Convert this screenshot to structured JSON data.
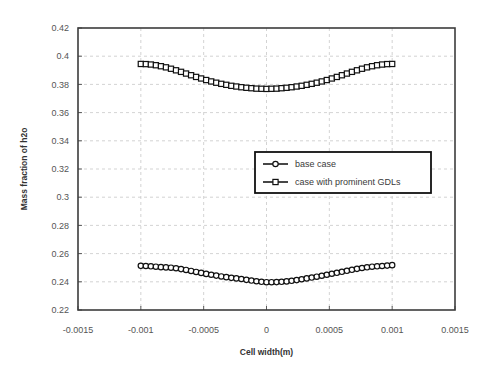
{
  "chart_data": {
    "type": "scatter",
    "title": "",
    "xlabel": "Cell width(m)",
    "ylabel": "Mass fraction of h2o",
    "xlim": [
      -0.0015,
      0.0015
    ],
    "ylim": [
      0.22,
      0.42
    ],
    "xticks": [
      "-0.0015",
      "-0.001",
      "-0.0005",
      "0",
      "0.0005",
      "0.001",
      "0.0015"
    ],
    "xtick_values": [
      -0.0015,
      -0.001,
      -0.0005,
      0,
      0.0005,
      0.001,
      0.0015
    ],
    "yticks": [
      "0.22",
      "0.24",
      "0.26",
      "0.28",
      "0.3",
      "0.32",
      "0.34",
      "0.36",
      "0.38",
      "0.4",
      "0.42"
    ],
    "ytick_values": [
      0.22,
      0.24,
      0.26,
      0.28,
      0.3,
      0.32,
      0.34,
      0.36,
      0.38,
      0.4,
      0.42
    ],
    "grid": true,
    "legend_position": "center-right",
    "x": [
      -0.001,
      -0.00096,
      -0.00092,
      -0.00088,
      -0.00084,
      -0.0008,
      -0.00076,
      -0.00072,
      -0.00068,
      -0.00064,
      -0.0006,
      -0.00056,
      -0.00052,
      -0.00048,
      -0.00044,
      -0.0004,
      -0.00036,
      -0.00032,
      -0.00028,
      -0.00024,
      -0.0002,
      -0.00016,
      -0.00012,
      -8e-05,
      -4e-05,
      0,
      4e-05,
      8e-05,
      0.00012,
      0.00016,
      0.0002,
      0.00024,
      0.00028,
      0.00032,
      0.00036,
      0.0004,
      0.00044,
      0.00048,
      0.00052,
      0.00056,
      0.0006,
      0.00064,
      0.00068,
      0.00072,
      0.00076,
      0.0008,
      0.00084,
      0.00088,
      0.00092,
      0.00096,
      0.001
    ],
    "series": [
      {
        "name": "case with prominent GDLs",
        "marker": "square",
        "values": [
          0.3945,
          0.3944,
          0.3941,
          0.3936,
          0.3929,
          0.3921,
          0.3911,
          0.39,
          0.3889,
          0.3877,
          0.3865,
          0.3853,
          0.3842,
          0.3831,
          0.3821,
          0.3812,
          0.3804,
          0.3797,
          0.379,
          0.3785,
          0.378,
          0.3776,
          0.3773,
          0.377,
          0.3769,
          0.3768,
          0.3769,
          0.377,
          0.3773,
          0.3776,
          0.378,
          0.3785,
          0.379,
          0.3797,
          0.3804,
          0.3812,
          0.3821,
          0.3831,
          0.3842,
          0.3853,
          0.3865,
          0.3877,
          0.3889,
          0.39,
          0.3911,
          0.3921,
          0.3929,
          0.3936,
          0.3941,
          0.3944,
          0.3945
        ]
      },
      {
        "name": "base case",
        "marker": "circle",
        "values": [
          0.2513,
          0.2512,
          0.251,
          0.2507,
          0.2504,
          0.2502,
          0.25,
          0.2496,
          0.249,
          0.2484,
          0.2477,
          0.247,
          0.2463,
          0.2456,
          0.245,
          0.2444,
          0.2438,
          0.2433,
          0.2428,
          0.2424,
          0.242,
          0.2414,
          0.2409,
          0.2404,
          0.24,
          0.2397,
          0.2397,
          0.2398,
          0.24,
          0.2403,
          0.2407,
          0.2412,
          0.2418,
          0.2424,
          0.243,
          0.2436,
          0.2443,
          0.245,
          0.2457,
          0.2464,
          0.2471,
          0.2478,
          0.2485,
          0.2492,
          0.2498,
          0.2503,
          0.2507,
          0.251,
          0.2512,
          0.2515,
          0.2518
        ]
      }
    ]
  },
  "legend": {
    "entries": [
      {
        "label": "base case",
        "marker": "circle"
      },
      {
        "label": "case with prominent GDLs",
        "marker": "square"
      }
    ]
  },
  "colors": {
    "line": "#1a1a1a",
    "marker_fill": "#ffffff",
    "grid": "#c8c8c8",
    "frame": "#3c3c3c",
    "text": "#555555",
    "background": "#ffffff"
  }
}
